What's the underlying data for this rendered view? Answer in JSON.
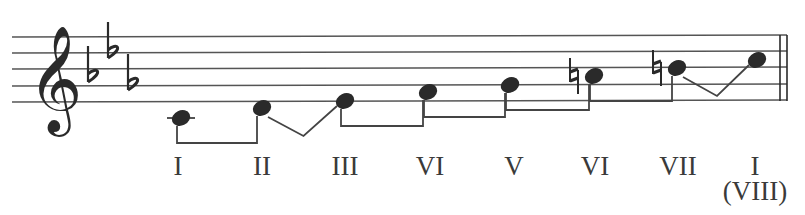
{
  "diagram": {
    "type": "musical-scale",
    "clef": "treble",
    "key_signature": {
      "accidental": "flat",
      "count": 3,
      "glyph": "♭"
    },
    "colors": {
      "ink": "#2a2a2a",
      "staff": "#555555",
      "label": "#3a3a3a",
      "background": "#ffffff"
    },
    "staff": {
      "x_start": 12,
      "x_end": 787,
      "lines_y": [
        37,
        53,
        69,
        86,
        102
      ]
    },
    "barline": {
      "type": "double",
      "x": [
        780,
        787
      ]
    },
    "notes": [
      {
        "degree": "I",
        "x": 181,
        "y": 118,
        "ledger": true,
        "accidental": ""
      },
      {
        "degree": "II",
        "x": 262,
        "y": 108,
        "ledger": false,
        "accidental": ""
      },
      {
        "degree": "III",
        "x": 345,
        "y": 101,
        "ledger": false,
        "accidental": ""
      },
      {
        "degree": "VI",
        "x": 428,
        "y": 92,
        "ledger": false,
        "accidental": ""
      },
      {
        "degree": "V",
        "x": 510,
        "y": 85,
        "ledger": false,
        "accidental": ""
      },
      {
        "degree": "VI",
        "x": 594,
        "y": 76,
        "ledger": false,
        "accidental": "natural"
      },
      {
        "degree": "VII",
        "x": 677,
        "y": 68,
        "ledger": false,
        "accidental": "natural"
      },
      {
        "degree": "I",
        "x": 757,
        "y": 60,
        "ledger": false,
        "accidental": "",
        "sub_label": "(VIII)"
      }
    ],
    "intervals": [
      {
        "from": 0,
        "to": 1,
        "kind": "whole"
      },
      {
        "from": 1,
        "to": 2,
        "kind": "half"
      },
      {
        "from": 2,
        "to": 3,
        "kind": "whole"
      },
      {
        "from": 3,
        "to": 4,
        "kind": "whole"
      },
      {
        "from": 4,
        "to": 5,
        "kind": "whole"
      },
      {
        "from": 5,
        "to": 6,
        "kind": "whole"
      },
      {
        "from": 6,
        "to": 7,
        "kind": "half"
      }
    ],
    "labels": [
      {
        "text": "I",
        "x": 178
      },
      {
        "text": "II",
        "x": 262
      },
      {
        "text": "III",
        "x": 345
      },
      {
        "text": "VI",
        "x": 430
      },
      {
        "text": "V",
        "x": 514
      },
      {
        "text": "VI",
        "x": 595
      },
      {
        "text": "VII",
        "x": 678
      },
      {
        "text": "I",
        "x": 755
      }
    ],
    "sub_label": {
      "text": "(VIII)",
      "x": 755
    }
  }
}
